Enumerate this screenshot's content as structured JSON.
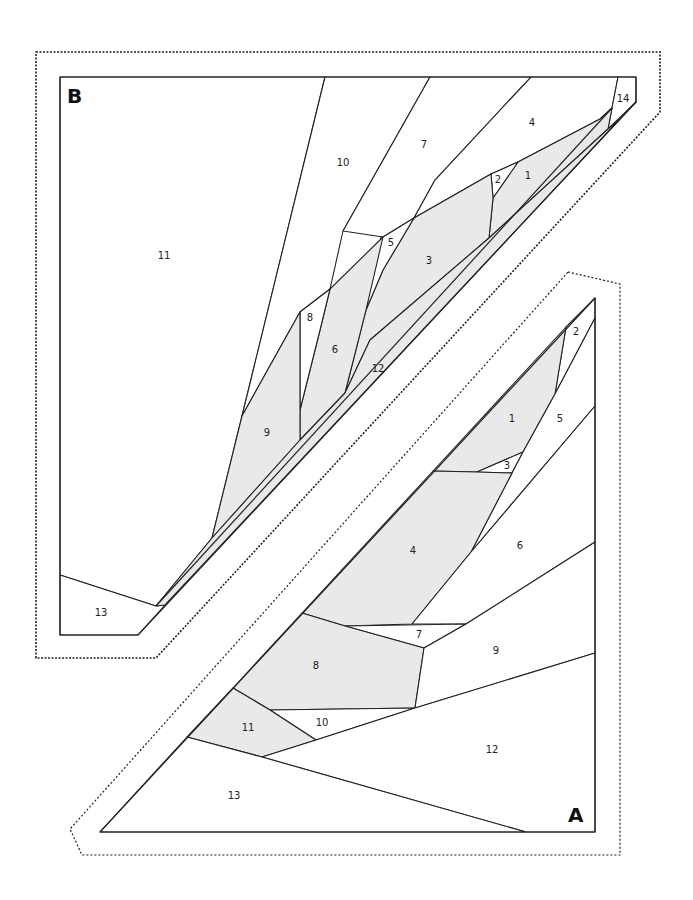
{
  "colors": {
    "line": "#222222",
    "shaded_fill": "#e9e9e9",
    "background": "#ffffff"
  },
  "sections": {
    "B": {
      "label": "B",
      "pieces": [
        {
          "id": "1",
          "label": "1",
          "shaded": true
        },
        {
          "id": "2",
          "label": "2",
          "shaded": false
        },
        {
          "id": "3",
          "label": "3",
          "shaded": true
        },
        {
          "id": "4",
          "label": "4",
          "shaded": false
        },
        {
          "id": "5",
          "label": "5",
          "shaded": false
        },
        {
          "id": "6",
          "label": "6",
          "shaded": true
        },
        {
          "id": "7",
          "label": "7",
          "shaded": false
        },
        {
          "id": "8",
          "label": "8",
          "shaded": false
        },
        {
          "id": "9",
          "label": "9",
          "shaded": true
        },
        {
          "id": "10",
          "label": "10",
          "shaded": false
        },
        {
          "id": "11",
          "label": "11",
          "shaded": false
        },
        {
          "id": "12",
          "label": "12",
          "shaded": true
        },
        {
          "id": "13",
          "label": "13",
          "shaded": false
        },
        {
          "id": "14",
          "label": "14",
          "shaded": false
        }
      ]
    },
    "A": {
      "label": "A",
      "pieces": [
        {
          "id": "1",
          "label": "1",
          "shaded": true
        },
        {
          "id": "2",
          "label": "2",
          "shaded": false
        },
        {
          "id": "3",
          "label": "3",
          "shaded": false
        },
        {
          "id": "4",
          "label": "4",
          "shaded": true
        },
        {
          "id": "5",
          "label": "5",
          "shaded": false
        },
        {
          "id": "6",
          "label": "6",
          "shaded": false
        },
        {
          "id": "7",
          "label": "7",
          "shaded": false
        },
        {
          "id": "8",
          "label": "8",
          "shaded": true
        },
        {
          "id": "9",
          "label": "9",
          "shaded": false
        },
        {
          "id": "10",
          "label": "10",
          "shaded": false
        },
        {
          "id": "11",
          "label": "11",
          "shaded": true
        },
        {
          "id": "12",
          "label": "12",
          "shaded": false
        },
        {
          "id": "13",
          "label": "13",
          "shaded": false
        }
      ]
    }
  }
}
